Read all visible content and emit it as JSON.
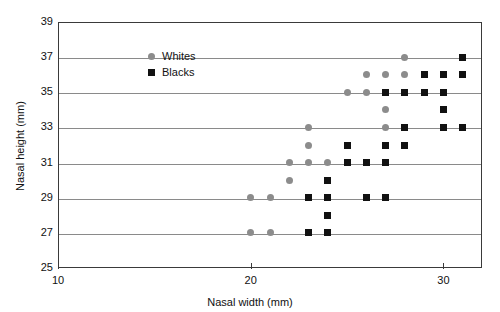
{
  "chart_data": {
    "type": "scatter",
    "title": "",
    "xlabel": "Nasal width (mm)",
    "ylabel": "Nasal height (mm)",
    "xlim": [
      10,
      32
    ],
    "ylim": [
      25,
      39
    ],
    "xticks": [
      10,
      20,
      30
    ],
    "yticks": [
      25,
      27,
      29,
      31,
      33,
      35,
      37,
      39
    ],
    "xtick_labels": [
      "10",
      "20",
      "30"
    ],
    "ytick_labels": [
      "25",
      "27",
      "29",
      "31",
      "33",
      "35",
      "37",
      "39"
    ],
    "grid": "horizontal",
    "legend_position": "upper-left-inside",
    "series": [
      {
        "name": "Whites",
        "marker": "circle",
        "color": "#8c8c8c",
        "points": [
          [
            20,
            27
          ],
          [
            21,
            27
          ],
          [
            20,
            29
          ],
          [
            21,
            29
          ],
          [
            22,
            30
          ],
          [
            22,
            31
          ],
          [
            23,
            31
          ],
          [
            24,
            31
          ],
          [
            23,
            32
          ],
          [
            25,
            32
          ],
          [
            23,
            33
          ],
          [
            27,
            33
          ],
          [
            27,
            34
          ],
          [
            25,
            35
          ],
          [
            26,
            35
          ],
          [
            26,
            36
          ],
          [
            27,
            36
          ],
          [
            28,
            36
          ],
          [
            28,
            37
          ]
        ]
      },
      {
        "name": "Blacks",
        "marker": "square",
        "color": "#111111",
        "points": [
          [
            23,
            27
          ],
          [
            24,
            27
          ],
          [
            24,
            28
          ],
          [
            23,
            29
          ],
          [
            24,
            29
          ],
          [
            26,
            29
          ],
          [
            27,
            29
          ],
          [
            24,
            30
          ],
          [
            25,
            31
          ],
          [
            26,
            31
          ],
          [
            27,
            31
          ],
          [
            25,
            32
          ],
          [
            27,
            32
          ],
          [
            28,
            32
          ],
          [
            28,
            33
          ],
          [
            30,
            33
          ],
          [
            31,
            33
          ],
          [
            30,
            34
          ],
          [
            27,
            35
          ],
          [
            28,
            35
          ],
          [
            29,
            35
          ],
          [
            30,
            35
          ],
          [
            29,
            36
          ],
          [
            30,
            36
          ],
          [
            31,
            36
          ],
          [
            31,
            37
          ]
        ]
      }
    ]
  },
  "legend": {
    "entries": [
      {
        "label": "Whites",
        "marker": "circle"
      },
      {
        "label": "Blacks",
        "marker": "square"
      }
    ]
  }
}
